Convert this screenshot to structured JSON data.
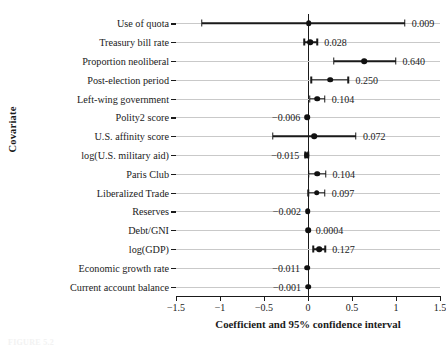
{
  "chart_data": {
    "type": "scatter",
    "title": "",
    "xlabel": "Coefficient and 95% confidence interval",
    "ylabel": "Covariate",
    "xlim": [
      -1.5,
      1.5
    ],
    "xticks": [
      -1.5,
      -1,
      -0.5,
      0,
      0.5,
      1,
      1.5
    ],
    "xticklabels": [
      "−1.5",
      "−1",
      "−0.5",
      "0",
      "0.5",
      "1",
      "1.5"
    ],
    "grid": true,
    "zero_reference_line": 0,
    "legend": "none",
    "categories": [
      "Use of quota",
      "Treasury bill rate",
      "Proportion neoliberal",
      "Post-election period",
      "Left-wing government",
      "Polity2 score",
      "U.S. affinity score",
      "log(U.S. military aid)",
      "Paris Club",
      "Liberalized Trade",
      "Reserves",
      "Debt/GNI",
      "log(GDP)",
      "Economic growth rate",
      "Current account balance"
    ],
    "points": [
      {
        "label": "Use of quota",
        "value": 0.009,
        "value_text": "0.009",
        "ci_low": -1.205,
        "ci_high": 1.1,
        "label_side": "right"
      },
      {
        "label": "Treasury bill rate",
        "value": 0.028,
        "value_text": "0.028",
        "ci_low": -0.04,
        "ci_high": 0.105,
        "label_side": "right"
      },
      {
        "label": "Proportion neoliberal",
        "value": 0.64,
        "value_text": "0.640",
        "ci_low": 0.29,
        "ci_high": 0.995,
        "label_side": "right"
      },
      {
        "label": "Post-election period",
        "value": 0.25,
        "value_text": "0.250",
        "ci_low": 0.035,
        "ci_high": 0.46,
        "label_side": "right"
      },
      {
        "label": "Left-wing government",
        "value": 0.104,
        "value_text": "0.104",
        "ci_low": 0.02,
        "ci_high": 0.19,
        "label_side": "right"
      },
      {
        "label": "Polity2 score",
        "value": -0.006,
        "value_text": "−0.006",
        "ci_low": -0.02,
        "ci_high": 0.01,
        "label_side": "left"
      },
      {
        "label": "U.S. affinity score",
        "value": 0.072,
        "value_text": "0.072",
        "ci_low": -0.4,
        "ci_high": 0.545,
        "label_side": "right"
      },
      {
        "label": "log(U.S. military aid)",
        "value": -0.015,
        "value_text": "−0.015",
        "ci_low": -0.03,
        "ci_high": 0.005,
        "label_side": "left"
      },
      {
        "label": "Paris Club",
        "value": 0.104,
        "value_text": "0.104",
        "ci_low": 0.01,
        "ci_high": 0.2,
        "label_side": "right"
      },
      {
        "label": "Liberalized Trade",
        "value": 0.097,
        "value_text": "0.097",
        "ci_low": 0.005,
        "ci_high": 0.19,
        "label_side": "right"
      },
      {
        "label": "Reserves",
        "value": -0.002,
        "value_text": "−0.002",
        "ci_low": -0.012,
        "ci_high": 0.008,
        "label_side": "left"
      },
      {
        "label": "Debt/GNI",
        "value": 0.0004,
        "value_text": "0.0004",
        "ci_low": -0.008,
        "ci_high": 0.009,
        "label_side": "right"
      },
      {
        "label": "log(GDP)",
        "value": 0.127,
        "value_text": "0.127",
        "ci_low": 0.06,
        "ci_high": 0.195,
        "label_side": "right"
      },
      {
        "label": "Economic growth rate",
        "value": -0.011,
        "value_text": "−0.011",
        "ci_low": -0.022,
        "ci_high": 0.001,
        "label_side": "left"
      },
      {
        "label": "Current account balance",
        "value": -0.001,
        "value_text": "−0.001",
        "ci_low": -0.01,
        "ci_high": 0.008,
        "label_side": "left"
      }
    ]
  },
  "caption": "FIGURE 5.2"
}
